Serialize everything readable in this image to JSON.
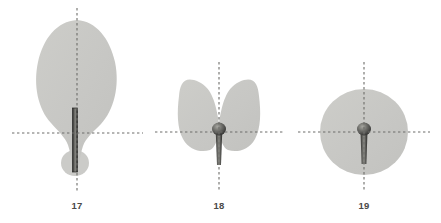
{
  "figure": {
    "background_color": "#ffffff",
    "blade_fill": "#c8c8c5",
    "blade_fill_light": "#cfcfcb",
    "petiole_dark": "#3a3a38",
    "petiole_mid": "#6e6e6a",
    "petiole_light": "#9a9a96",
    "axis_color": "#6d6d6a",
    "label_color": "#4a4a48"
  },
  "specimens": [
    {
      "number": "17",
      "shape_name": "ovate-elliptic-leaf",
      "label": "17",
      "label_x": 57,
      "label_y": 200,
      "center_x": 77,
      "center_y": 133,
      "vertical_axis": {
        "x": 77,
        "y1": 8,
        "y2": 191
      },
      "horizontal_axis": {
        "y": 133,
        "x1": 12,
        "x2": 143
      },
      "blade": {
        "top": 20,
        "bottom": 152,
        "left": 38,
        "right": 116,
        "widest_y": 78
      },
      "basal_lobe": {
        "cx": 75,
        "cy": 163,
        "rx": 14,
        "ry": 13
      },
      "petiole": {
        "x": 73,
        "top": 108,
        "bottom": 172,
        "width": 5,
        "style": "straight-bar"
      }
    },
    {
      "number": "18",
      "shape_name": "cordate-leaf",
      "label": "18",
      "label_x": 199,
      "label_y": 200,
      "center_x": 219,
      "center_y": 132,
      "vertical_axis": {
        "x": 219,
        "y1": 62,
        "y2": 192
      },
      "horizontal_axis": {
        "y": 132,
        "x1": 155,
        "x2": 283
      },
      "blade": {
        "top": 80,
        "bottom": 152,
        "left": 178,
        "right": 266
      },
      "petiole": {
        "x": 219,
        "top": 125,
        "bottom": 165,
        "width_top": 7,
        "width_bottom": 4,
        "style": "tapered-with-knob"
      },
      "knob": {
        "cx": 219,
        "cy": 129,
        "rx": 7,
        "ry": 6.5
      }
    },
    {
      "number": "19",
      "shape_name": "orbicular-peltate-leaf",
      "label": "19",
      "label_x": 344,
      "label_y": 200,
      "center_x": 364,
      "center_y": 132,
      "vertical_axis": {
        "x": 364,
        "y1": 62,
        "y2": 192
      },
      "horizontal_axis": {
        "y": 132,
        "x1": 298,
        "x2": 430
      },
      "blade": {
        "cx": 364,
        "cy": 132,
        "rx": 44,
        "ry": 43
      },
      "petiole": {
        "x": 364,
        "top": 125,
        "bottom": 164,
        "width_top": 7,
        "width_bottom": 5,
        "style": "tapered-with-knob"
      },
      "knob": {
        "cx": 364,
        "cy": 129,
        "rx": 7,
        "ry": 6.5
      }
    }
  ]
}
